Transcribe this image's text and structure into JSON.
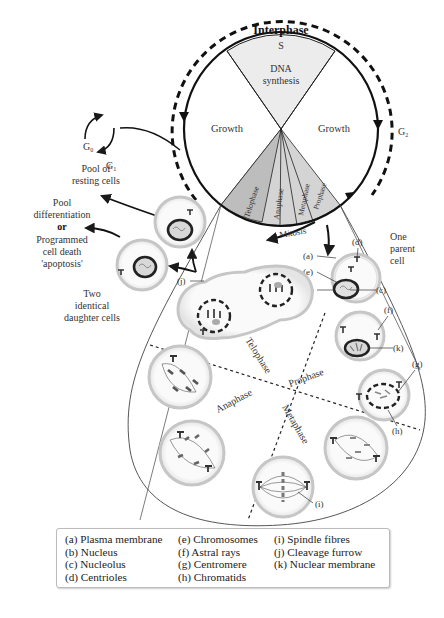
{
  "cycle": {
    "ring_label": "Interphase",
    "s_label": "S",
    "dna_label_1": "DNA",
    "dna_label_2": "synthesis",
    "growth_left": "Growth",
    "growth_right": "Growth",
    "mitosis_phases": [
      "Telophase",
      "Anaphase",
      "Metaphase",
      "Prophase"
    ],
    "mitosis_label": "Mitosis",
    "g1_label": "G",
    "g1_sub": "1",
    "g0_label": "G",
    "g0_sub": "0",
    "g2_label": "G",
    "g2_sub": "2"
  },
  "annotations": {
    "resting_1": "Pool of",
    "resting_2": "resting cells",
    "diff_1": "Pool",
    "diff_2": "differentiation",
    "diff_or": "or",
    "diff_3": "Programmed",
    "diff_4": "cell death",
    "diff_5": "'apoptosis'",
    "daughters_1": "Two",
    "daughters_2": "identical",
    "daughters_3": "daughter cells",
    "parent_1": "One",
    "parent_2": "parent",
    "parent_3": "cell"
  },
  "teardrop_phases": {
    "telophase": "Telophase",
    "prophase": "Prophase",
    "anaphase": "Anaphase",
    "metaphase": "Metaphase"
  },
  "markers": {
    "a": "(a)",
    "b": "(b)",
    "c": "(c)",
    "d": "(d)",
    "e": "(e)",
    "f": "(f)",
    "g": "(g)",
    "h": "(h)",
    "i": "(i)",
    "j": "(j)",
    "k": "(k)"
  },
  "legend": {
    "items": [
      "(a) Plasma membrane",
      "(e) Chromosomes",
      "(i) Spindle fibres",
      "(b) Nucleus",
      "(f) Astral rays",
      "(j) Cleavage furrow",
      "(c) Nucleolus",
      "(g) Centromere",
      "(k) Nuclear membrane",
      "(d) Centrioles",
      "(h) Chromatids",
      ""
    ]
  },
  "colors": {
    "line": "#1a1a1a",
    "s_fill": "#e6e6e6",
    "mitosis_fill": "#c8c8c8",
    "cell_membrane": "#c9c9c9",
    "text": "#333333"
  }
}
